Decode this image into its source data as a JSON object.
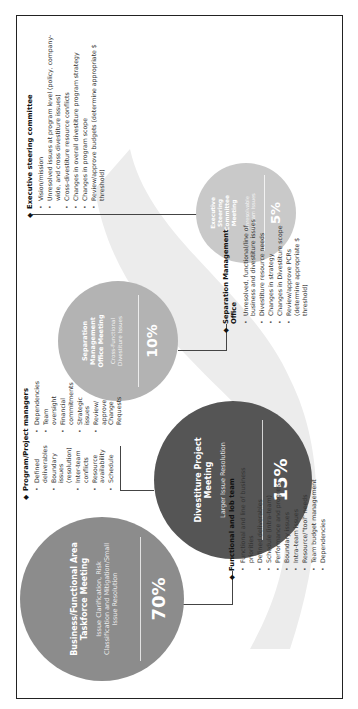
{
  "circles": [
    {
      "id": "c70",
      "percent": "70%",
      "title": "Business/Functional Area Taskforce Meeting",
      "subtitle": "Issue Clarification, Risk Classification and Mitigation/Small Issue Resolution",
      "color": "#8c8c8c"
    },
    {
      "id": "c15",
      "percent": "15%",
      "title": "Divestiture Project Meeting",
      "subtitle": "Larger Issue Resolution",
      "color": "#555555"
    },
    {
      "id": "c10",
      "percent": "10%",
      "title": "Separation Management Office Meeting",
      "subtitle": "Cross-Functional Divestiture Issues",
      "color": "#b3b3b3"
    },
    {
      "id": "c5",
      "percent": "5%",
      "title": "Executive Steering Committee Meeting",
      "subtitle": "Unresolvable Program Issues",
      "color": "#c9c9c9"
    }
  ],
  "notes": {
    "functional": {
      "heading": "Functional and lob team",
      "items": [
        "Functional and line of business priorities",
        "Defined deliverables",
        "Schedule (intra-team)",
        "Performance and progress",
        "Boundary issues",
        "Intra-team issues",
        "Resource/\"tool\" needs",
        "Team budget management",
        "Dependencies"
      ]
    },
    "program": {
      "heading": "Program/Project managers",
      "col1": [
        "Defined deliverables",
        "Boundary issues (resolution)",
        "Inter-team conflicts",
        "Resource availability",
        "Schedule"
      ],
      "col2": [
        "Dependencies",
        "Team oversight",
        "Financial commitments",
        "Strategic issues",
        "Review/ approve Change Requests"
      ]
    },
    "separation": {
      "heading": "Separation Management Office",
      "items": [
        "Unresolved, functional/line of business and divestiture issues",
        "Divestiture resource needs",
        "Changes in strategy",
        "Changes in Divestiture scope",
        "Review/approve PCRs (determine appropriate $ threshold)"
      ]
    },
    "executive": {
      "heading": "Executive steering committee",
      "items": [
        "Vision/mission",
        "Unresolved issues at program level (policy, company-wide, and cross divestiture issues)",
        "Cross-divestiture resource conflicts",
        "Changes in overall divestiture program strategy",
        "Changes in program scope",
        "Review/approve budgets (determine appropriate $ threshold)"
      ]
    }
  }
}
